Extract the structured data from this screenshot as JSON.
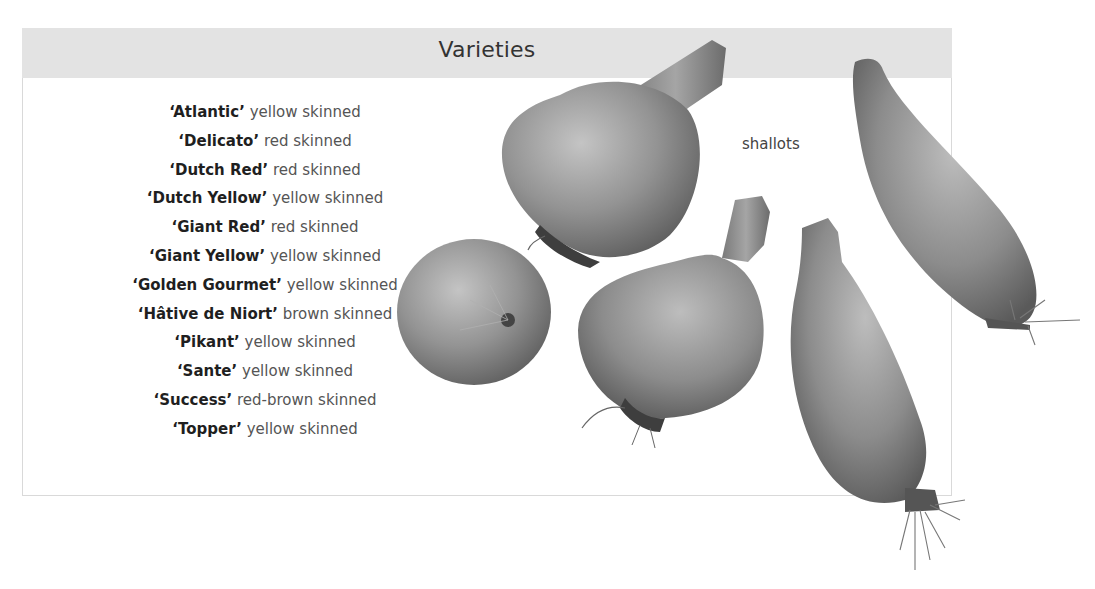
{
  "header": {
    "title": "Varieties"
  },
  "varieties": [
    {
      "name": "‘Atlantic’",
      "desc": "yellow skinned"
    },
    {
      "name": "‘Delicato’",
      "desc": "red skinned"
    },
    {
      "name": "‘Dutch Red’",
      "desc": "red skinned"
    },
    {
      "name": "‘Dutch Yellow’",
      "desc": "yellow skinned"
    },
    {
      "name": "‘Giant Red’",
      "desc": "red skinned"
    },
    {
      "name": "‘Giant Yellow’",
      "desc": "yellow skinned"
    },
    {
      "name": "‘Golden Gourmet’",
      "desc": "yellow skinned"
    },
    {
      "name": "‘Hâtive de Niort’",
      "desc": "brown skinned"
    },
    {
      "name": "‘Pikant’",
      "desc": "yellow skinned"
    },
    {
      "name": "‘Sante’",
      "desc": "yellow skinned"
    },
    {
      "name": "‘Success’",
      "desc": "red-brown skinned"
    },
    {
      "name": "‘Topper’",
      "desc": "yellow skinned"
    }
  ],
  "image": {
    "label": "shallots",
    "subjects": [
      "round onion",
      "round onion with long neck",
      "teardrop onion",
      "elongated shallot",
      "elongated shallot"
    ]
  },
  "colors": {
    "header_band": "#e3e3e3",
    "panel_border": "#d9d9d9",
    "name_text": "#1f1f1f",
    "desc_text": "#555555",
    "bulb": "#8f8f8f"
  }
}
